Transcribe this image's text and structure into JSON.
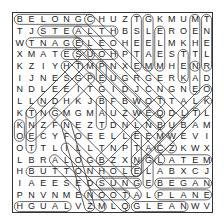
{
  "puzzle": {
    "rows": [
      "BELONGCHUZTGKMUMT",
      "TJSTEALTHBSLEROEN",
      "WTNAGELEOHEELMKHE",
      "XMATESUOHPTAESTTL",
      "KZIYHTMPNXEMMHENR",
      "IJNESGPEUGRGERKAD",
      "NDLEEITGIDJCNGNEO",
      "LLNDHKJBFBWOTTALK",
      "KTNGMGMAUZWEQDLTL",
      "KNZFNEZTDNLNBUBAM",
      "OECYFOEELLEEMWEVI",
      "OTTLILLTNPTACZKWX",
      "LBRALOGBZXNGLATEM",
      "HBUTTONHOLELABXCJ",
      "IAEESEDSUNGEBEGAN",
      "PNVNMENOOTALPLANE",
      "HGUALVZMLQGLEANWV"
    ],
    "found_words": [
      {
        "word": "BELONG",
        "r1": 0,
        "c1": 0,
        "r2": 0,
        "c2": 6
      },
      {
        "word": "STEALTH",
        "r1": 1,
        "c1": 2,
        "r2": 1,
        "c2": 8
      },
      {
        "word": "TNAGE",
        "r1": 2,
        "c1": 1,
        "r2": 2,
        "c2": 5
      },
      {
        "word": "ESUOH",
        "r1": 3,
        "c1": 4,
        "r2": 3,
        "c2": 8
      },
      {
        "word": "LATEM",
        "r1": 12,
        "c1": 12,
        "r2": 12,
        "c2": 16
      },
      {
        "word": "BUTTONHOLE",
        "r1": 13,
        "c1": 1,
        "r2": 13,
        "c2": 10
      },
      {
        "word": "SUNG",
        "r1": 14,
        "c1": 7,
        "r2": 14,
        "c2": 10
      },
      {
        "word": "BEGAN",
        "r1": 14,
        "c1": 12,
        "r2": 14,
        "c2": 16
      },
      {
        "word": "NOOT",
        "r1": 15,
        "c1": 6,
        "r2": 15,
        "c2": 9
      },
      {
        "word": "PLANE",
        "r1": 15,
        "c1": 12,
        "r2": 15,
        "c2": 16
      },
      {
        "word": "HGUAL",
        "r1": 16,
        "c1": 0,
        "r2": 16,
        "c2": 4
      },
      {
        "word": "GLEAN",
        "r1": 16,
        "c1": 10,
        "r2": 16,
        "c2": 14
      },
      {
        "word": "TSETE",
        "r1": 0,
        "c1": 10,
        "r2": 4,
        "c2": 10
      },
      {
        "word": "GLEAM",
        "r1": 0,
        "c1": 11,
        "r2": 4,
        "c2": 11
      },
      {
        "word": "ELEM",
        "r1": 1,
        "c1": 12,
        "r2": 4,
        "c2": 12
      },
      {
        "word": "MEHTN",
        "r1": 0,
        "c1": 15,
        "r2": 4,
        "c2": 15
      },
      {
        "word": "TNELR",
        "r1": 0,
        "c1": 16,
        "r2": 4,
        "c2": 16
      },
      {
        "word": "TEN",
        "r1": 3,
        "c1": 14,
        "r2": 5,
        "c2": 14
      },
      {
        "word": "NAE",
        "r1": 4,
        "c1": 15,
        "r2": 6,
        "c2": 15
      },
      {
        "word": "PE",
        "r1": 4,
        "c1": 7,
        "r2": 5,
        "c2": 7
      },
      {
        "word": "BAT",
        "r1": 7,
        "c1": 7,
        "r2": 9,
        "c2": 7
      },
      {
        "word": "TNET",
        "r1": 8,
        "c1": 1,
        "r2": 11,
        "c2": 1
      },
      {
        "word": "ELEL",
        "r1": 10,
        "c1": 10,
        "r2": 13,
        "c2": 10
      },
      {
        "word": "GEE",
        "r1": 12,
        "c1": 11,
        "r2": 14,
        "c2": 11
      },
      {
        "word": "KO",
        "r1": 9,
        "c1": 0,
        "r2": 10,
        "c2": 0
      }
    ],
    "diagonals": [
      {
        "r1": 0,
        "c1": 6,
        "r2": 8,
        "c2": 14
      },
      {
        "r1": 1,
        "c1": 5,
        "r2": 8,
        "c2": 12
      },
      {
        "r1": 2,
        "c1": 5,
        "r2": 9,
        "c2": 12
      },
      {
        "r1": 4,
        "c1": 4,
        "r2": 12,
        "c2": 12
      },
      {
        "r1": 3,
        "c1": 5,
        "r2": 11,
        "c2": 13
      },
      {
        "r1": 4,
        "c1": 5,
        "r2": 8,
        "c2": 1
      },
      {
        "r1": 3,
        "c1": 6,
        "r2": 7,
        "c2": 2
      },
      {
        "r1": 5,
        "c1": 6,
        "r2": 10,
        "c2": 1
      },
      {
        "r1": 6,
        "c1": 16,
        "r2": 12,
        "c2": 10
      },
      {
        "r1": 7,
        "c1": 16,
        "r2": 13,
        "c2": 10
      },
      {
        "r1": 8,
        "c1": 15,
        "r2": 11,
        "c2": 12
      },
      {
        "r1": 7,
        "c1": 12,
        "r2": 12,
        "c2": 7
      },
      {
        "r1": 8,
        "c1": 3,
        "r2": 15,
        "c2": 10
      },
      {
        "r1": 9,
        "c1": 4,
        "r2": 16,
        "c2": 6
      },
      {
        "r1": 11,
        "c1": 4,
        "r2": 16,
        "c2": 9
      },
      {
        "r1": 12,
        "c1": 3,
        "r2": 16,
        "c2": 7
      }
    ]
  },
  "colors": {
    "letter": "#222222",
    "outline": "#444444",
    "border": "#333333",
    "background": "#ffffff"
  }
}
